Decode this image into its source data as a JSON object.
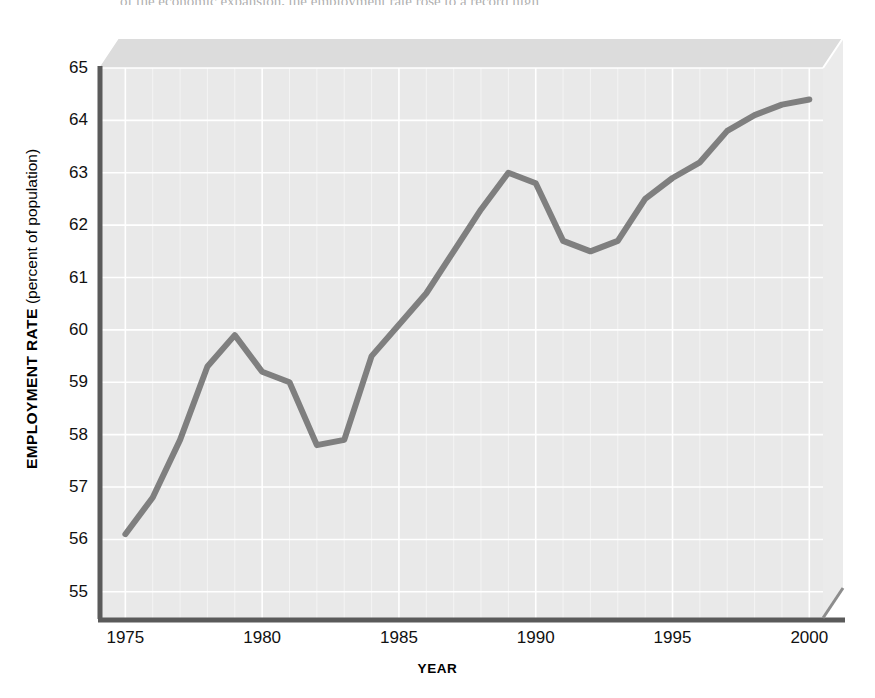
{
  "figure": {
    "scan_residue_text": "of the economic expansion, the employment rate rose to a record high",
    "background_color": "#ffffff",
    "plot_fill_color": "#e8e8e8",
    "plot_bevel_color": "#d9d9d9",
    "gridline_color": "#ffffff",
    "axis_color": "#595959",
    "line_color": "#808080"
  },
  "chart_data": {
    "type": "line",
    "title": "",
    "xlabel": "YEAR",
    "ylabel": "EMPLOYMENT RATE (percent of population)",
    "ylabel_bold_part": "EMPLOYMENT RATE",
    "ylabel_plain_part": "(percent of population)",
    "xlim": [
      1974,
      2000.5
    ],
    "ylim": [
      54.5,
      65
    ],
    "xticks": [
      1975,
      1980,
      1985,
      1990,
      1995,
      2000
    ],
    "yticks": [
      55,
      56,
      57,
      58,
      59,
      60,
      61,
      62,
      63,
      64,
      65
    ],
    "grid": true,
    "grid_minor_x": true,
    "legend": "none",
    "series": [
      {
        "name": "Employment rate",
        "x": [
          1975,
          1976,
          1977,
          1978,
          1979,
          1980,
          1981,
          1982,
          1983,
          1984,
          1985,
          1986,
          1987,
          1988,
          1989,
          1990,
          1991,
          1992,
          1993,
          1994,
          1995,
          1996,
          1997,
          1998,
          1999,
          2000
        ],
        "values": [
          56.1,
          56.8,
          57.9,
          59.3,
          59.9,
          59.2,
          59.0,
          57.8,
          57.9,
          59.5,
          60.1,
          60.7,
          61.5,
          62.3,
          63.0,
          62.8,
          61.7,
          61.5,
          61.7,
          62.5,
          62.9,
          63.2,
          63.8,
          64.1,
          64.3,
          64.4
        ]
      }
    ]
  }
}
